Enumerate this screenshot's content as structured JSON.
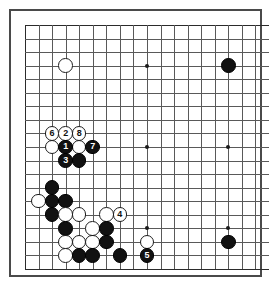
{
  "diagram": {
    "type": "go-board",
    "board_size": 19,
    "title": "",
    "geometry": {
      "origin_x": 14,
      "origin_y": 14,
      "spacing": 13.55,
      "stone_diameter": 14.6
    },
    "colors": {
      "background": "#ffffff",
      "grid": "#595959",
      "grid_edge": "#2b2b2b",
      "frame": "#4a4a4a",
      "black_stone": "#111111",
      "white_stone": "#ffffff",
      "black_label": "#ffffff",
      "white_label": "#111111"
    },
    "star_points": [
      {
        "col": 3,
        "row": 3
      },
      {
        "col": 9,
        "row": 3
      },
      {
        "col": 15,
        "row": 3
      },
      {
        "col": 3,
        "row": 9
      },
      {
        "col": 9,
        "row": 9
      },
      {
        "col": 15,
        "row": 9
      },
      {
        "col": 3,
        "row": 15
      },
      {
        "col": 9,
        "row": 15
      },
      {
        "col": 15,
        "row": 15
      }
    ],
    "stones": [
      {
        "col": 3,
        "row": 3,
        "color": "white",
        "label": ""
      },
      {
        "col": 15,
        "row": 3,
        "color": "black",
        "label": ""
      },
      {
        "col": 15,
        "row": 16,
        "color": "black",
        "label": ""
      },
      {
        "col": 2,
        "row": 8,
        "color": "white",
        "label": "6"
      },
      {
        "col": 3,
        "row": 8,
        "color": "white",
        "label": "2"
      },
      {
        "col": 4,
        "row": 8,
        "color": "white",
        "label": "8"
      },
      {
        "col": 2,
        "row": 9,
        "color": "white",
        "label": ""
      },
      {
        "col": 3,
        "row": 9,
        "color": "black",
        "label": "1"
      },
      {
        "col": 4,
        "row": 9,
        "color": "white",
        "label": ""
      },
      {
        "col": 5,
        "row": 9,
        "color": "black",
        "label": "7"
      },
      {
        "col": 3,
        "row": 10,
        "color": "black",
        "label": "3"
      },
      {
        "col": 4,
        "row": 10,
        "color": "black",
        "label": ""
      },
      {
        "col": 2,
        "row": 12,
        "color": "black",
        "label": ""
      },
      {
        "col": 1,
        "row": 13,
        "color": "white",
        "label": ""
      },
      {
        "col": 2,
        "row": 13,
        "color": "black",
        "label": ""
      },
      {
        "col": 3,
        "row": 13,
        "color": "black",
        "label": ""
      },
      {
        "col": 2,
        "row": 14,
        "color": "black",
        "label": ""
      },
      {
        "col": 3,
        "row": 14,
        "color": "white",
        "label": ""
      },
      {
        "col": 4,
        "row": 14,
        "color": "white",
        "label": ""
      },
      {
        "col": 6,
        "row": 14,
        "color": "white",
        "label": ""
      },
      {
        "col": 7,
        "row": 14,
        "color": "white",
        "label": "4"
      },
      {
        "col": 3,
        "row": 15,
        "color": "black",
        "label": ""
      },
      {
        "col": 5,
        "row": 15,
        "color": "white",
        "label": ""
      },
      {
        "col": 6,
        "row": 15,
        "color": "black",
        "label": ""
      },
      {
        "col": 3,
        "row": 16,
        "color": "white",
        "label": ""
      },
      {
        "col": 4,
        "row": 16,
        "color": "white",
        "label": ""
      },
      {
        "col": 5,
        "row": 16,
        "color": "white",
        "label": ""
      },
      {
        "col": 6,
        "row": 16,
        "color": "black",
        "label": ""
      },
      {
        "col": 9,
        "row": 16,
        "color": "white",
        "label": ""
      },
      {
        "col": 3,
        "row": 17,
        "color": "white",
        "label": ""
      },
      {
        "col": 4,
        "row": 17,
        "color": "black",
        "label": ""
      },
      {
        "col": 5,
        "row": 17,
        "color": "black",
        "label": ""
      },
      {
        "col": 7,
        "row": 17,
        "color": "black",
        "label": ""
      },
      {
        "col": 9,
        "row": 17,
        "color": "black",
        "label": "5"
      }
    ]
  }
}
